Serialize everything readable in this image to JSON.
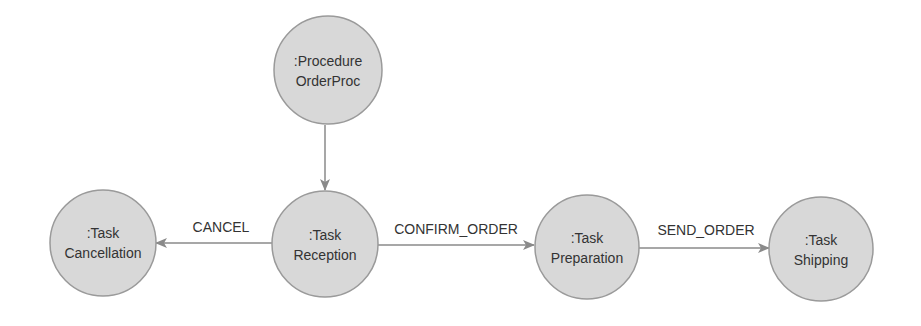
{
  "diagram": {
    "type": "state-transition",
    "colors": {
      "node_fill": "#d8d8d8",
      "node_stroke": "#9a9a9a",
      "edge": "#8a8a8a",
      "text": "#333333"
    },
    "nodes": {
      "procedure": {
        "type": ":Procedure",
        "name": "OrderProc"
      },
      "cancellation": {
        "type": ":Task",
        "name": "Cancellation"
      },
      "reception": {
        "type": ":Task",
        "name": "Reception"
      },
      "preparation": {
        "type": ":Task",
        "name": "Preparation"
      },
      "shipping": {
        "type": ":Task",
        "name": "Shipping"
      }
    },
    "edges": {
      "procedure_to_reception": {
        "from": "procedure",
        "to": "reception",
        "label": ""
      },
      "cancel": {
        "from": "reception",
        "to": "cancellation",
        "label": "CANCEL"
      },
      "confirm_order": {
        "from": "reception",
        "to": "preparation",
        "label": "CONFIRM_ORDER"
      },
      "send_order": {
        "from": "preparation",
        "to": "shipping",
        "label": "SEND_ORDER"
      }
    }
  }
}
